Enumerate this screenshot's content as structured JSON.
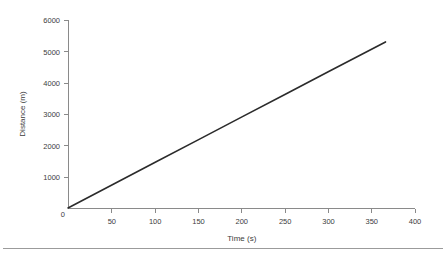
{
  "chart_data": {
    "type": "line",
    "title": "",
    "xlabel": "Time (s)",
    "ylabel": "Distance (m)",
    "xlim": [
      0,
      400
    ],
    "ylim": [
      0,
      6000
    ],
    "xticks": [
      0,
      50,
      100,
      150,
      200,
      250,
      300,
      350,
      400
    ],
    "xtick_labels": [
      "0",
      "50",
      "100",
      "150",
      "200",
      "250",
      "300",
      "350",
      "400"
    ],
    "yticks": [
      0,
      1000,
      2000,
      3000,
      4000,
      5000,
      6000
    ],
    "ytick_labels": [
      "0",
      "1000",
      "2000",
      "3000",
      "4000",
      "5000",
      "6000"
    ],
    "grid": false,
    "legend": false,
    "origin_label": "0",
    "series": [
      {
        "name": "Distance vs Time",
        "color": "#2b2b2b",
        "x": [
          0,
          50,
          100,
          150,
          200,
          250,
          300,
          366
        ],
        "values": [
          0,
          725,
          1450,
          2175,
          2900,
          3625,
          4350,
          5300
        ]
      }
    ],
    "annotations": []
  },
  "figure": {
    "axis_color": "#8a8a8a",
    "text_color": "#3c3c3c",
    "background": "#ffffff",
    "footer_rule_color": "#9b9b9b"
  }
}
